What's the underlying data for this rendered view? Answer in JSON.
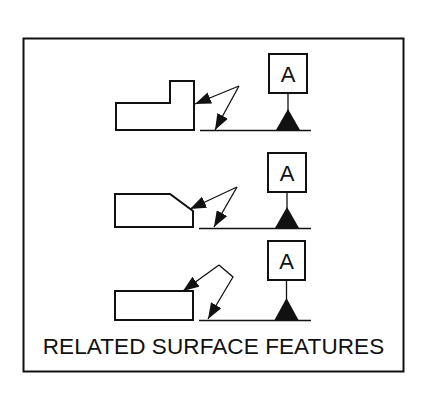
{
  "figure": {
    "caption": "RELATED SURFACE FEATURES",
    "ink_color": "#111111",
    "background": "#ffffff",
    "examples": [
      {
        "part_shape": "stepped-block",
        "datum_label": "A"
      },
      {
        "part_shape": "chamfered-block",
        "datum_label": "A"
      },
      {
        "part_shape": "flat-block",
        "datum_label": "A"
      }
    ]
  }
}
